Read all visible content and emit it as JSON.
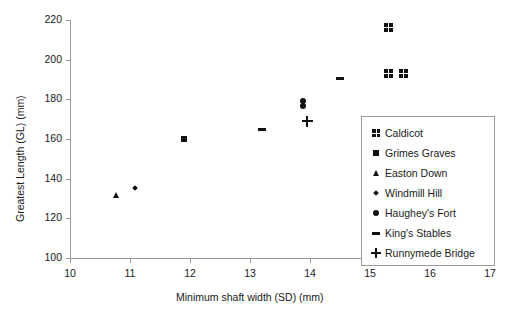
{
  "chart_data": {
    "type": "scatter",
    "title": "",
    "xlabel": "Minimum shaft width (SD) (mm)",
    "ylabel": "Greatest Length (GL) (mm)",
    "xlim": [
      10,
      17
    ],
    "ylim": [
      100,
      220
    ],
    "xticks": [
      10,
      11,
      12,
      13,
      14,
      15,
      16,
      17
    ],
    "yticks": [
      100,
      120,
      140,
      160,
      180,
      200,
      220
    ],
    "xtick_labels": [
      "10",
      "11",
      "12",
      "13",
      "14",
      "15",
      "16",
      "17"
    ],
    "ytick_labels": [
      "100",
      "120",
      "140",
      "160",
      "180",
      "200",
      "220"
    ],
    "grid": false,
    "legend_position": "lower-right-inside",
    "series": [
      {
        "name": "Caldicot",
        "marker": "four-dot-square",
        "points": [
          {
            "x": 15.3,
            "y": 216
          },
          {
            "x": 15.3,
            "y": 193
          },
          {
            "x": 15.55,
            "y": 193
          }
        ]
      },
      {
        "name": "Grimes Graves",
        "marker": "filled-square",
        "points": [
          {
            "x": 11.9,
            "y": 160
          }
        ]
      },
      {
        "name": "Easton Down",
        "marker": "filled-triangle",
        "points": [
          {
            "x": 10.78,
            "y": 132
          }
        ]
      },
      {
        "name": "Windmill Hill",
        "marker": "small-diamond",
        "points": [
          {
            "x": 11.08,
            "y": 135.5
          }
        ]
      },
      {
        "name": "Haughey's Fort",
        "marker": "filled-circle",
        "points": [
          {
            "x": 13.88,
            "y": 179
          },
          {
            "x": 13.88,
            "y": 176.5
          }
        ]
      },
      {
        "name": "King's Stables",
        "marker": "horizontal-dash",
        "points": [
          {
            "x": 13.2,
            "y": 165
          },
          {
            "x": 14.5,
            "y": 190.5
          }
        ]
      },
      {
        "name": "Runnymede Bridge",
        "marker": "plus",
        "points": [
          {
            "x": 13.95,
            "y": 169
          }
        ]
      }
    ]
  },
  "legend": {
    "items": [
      {
        "label": "Caldicot",
        "marker": "four-dot-square"
      },
      {
        "label": "Grimes Graves",
        "marker": "filled-square"
      },
      {
        "label": "Easton Down",
        "marker": "filled-triangle"
      },
      {
        "label": "Windmill Hill",
        "marker": "small-diamond"
      },
      {
        "label": "Haughey's Fort",
        "marker": "filled-circle"
      },
      {
        "label": "King's Stables",
        "marker": "horizontal-dash"
      },
      {
        "label": "Runnymede Bridge",
        "marker": "plus"
      }
    ]
  },
  "colors": {
    "marker": "#111111",
    "axis": "#9a9a9a",
    "text": "#1a1a1a",
    "background": "#ffffff"
  }
}
